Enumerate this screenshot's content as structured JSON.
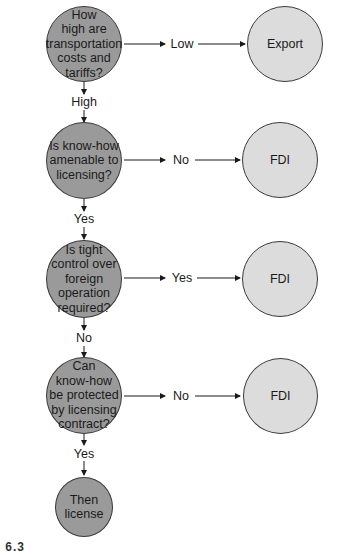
{
  "diagram": {
    "type": "decision-flowchart",
    "colors": {
      "question_fill": "#9a9a9a",
      "outcome_fill": "#dcdcdc",
      "stroke": "#3a3a3a"
    },
    "questions": [
      {
        "id": "q1",
        "text": "How\nhigh are\ntransportation\ncosts and\ntariffs?"
      },
      {
        "id": "q2",
        "text": "Is know-how\namenable to\nlicensing?"
      },
      {
        "id": "q3",
        "text": "Is tight\ncontrol over\nforeign\noperation\nrequired?"
      },
      {
        "id": "q4",
        "text": "Can\nknow-how\nbe protected\nby licensing\ncontract?"
      }
    ],
    "terminal": {
      "id": "t1",
      "text": "Then\nlicense"
    },
    "outcomes": [
      {
        "id": "o1",
        "text": "Export"
      },
      {
        "id": "o2",
        "text": "FDI"
      },
      {
        "id": "o3",
        "text": "FDI"
      },
      {
        "id": "o4",
        "text": "FDI"
      }
    ],
    "edges": [
      {
        "from": "q1",
        "to": "o1",
        "label": "Low"
      },
      {
        "from": "q1",
        "to": "q2",
        "label": "High"
      },
      {
        "from": "q2",
        "to": "o2",
        "label": "No"
      },
      {
        "from": "q2",
        "to": "q3",
        "label": "Yes"
      },
      {
        "from": "q3",
        "to": "o3",
        "label": "Yes"
      },
      {
        "from": "q3",
        "to": "q4",
        "label": "No"
      },
      {
        "from": "q4",
        "to": "o4",
        "label": "No"
      },
      {
        "from": "q4",
        "to": "t1",
        "label": "Yes"
      }
    ],
    "caption_fragment": "E 6.3"
  }
}
